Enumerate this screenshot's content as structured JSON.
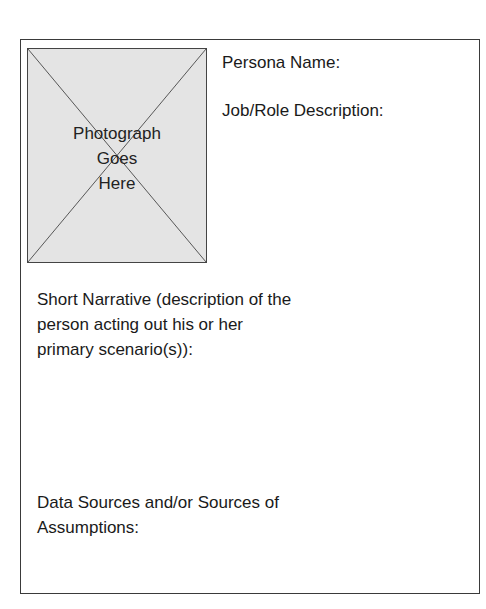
{
  "photo": {
    "icon": "image-placeholder-x-icon",
    "label_lines": [
      "Photograph",
      "Goes",
      "Here"
    ]
  },
  "fields": {
    "persona_name": "Persona Name:",
    "job_role": "Job/Role Description:",
    "narrative_lines": [
      "Short Narrative (description of the",
      "person acting out his or her",
      "primary scenario(s)):"
    ],
    "sources_lines": [
      "Data Sources and/or Sources of",
      "Assumptions:"
    ]
  },
  "colors": {
    "border": "#3a3a3a",
    "photo_fill": "#e4e4e4",
    "text": "#1a1a1a"
  }
}
